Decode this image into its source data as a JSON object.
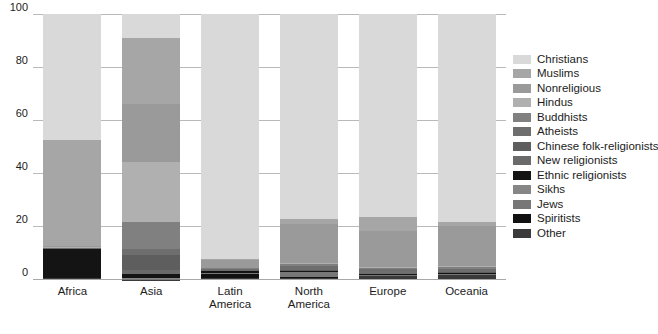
{
  "chart_data": {
    "type": "bar",
    "title": "",
    "subtitle": "",
    "xlabel": "",
    "ylabel": "",
    "ylim": [
      0,
      100
    ],
    "yticks": [
      0,
      20,
      40,
      60,
      80,
      100
    ],
    "grid": true,
    "stacked": true,
    "stack_order": "top-down",
    "legend_position": "right",
    "categories": [
      "Africa",
      "Asia",
      "Latin America",
      "North America",
      "Europe",
      "Oceania"
    ],
    "category_labels": [
      [
        "Africa"
      ],
      [
        "Asia"
      ],
      [
        "Latin",
        "America"
      ],
      [
        "North",
        "America"
      ],
      [
        "Europe"
      ],
      [
        "Oceania"
      ]
    ],
    "series": [
      {
        "name": "Christians",
        "color": "#d9d9d9",
        "values": [
          47.5,
          9.0,
          92.5,
          77.5,
          76.5,
          78.5
        ]
      },
      {
        "name": "Muslims",
        "color": "#a6a6a6",
        "values": [
          40.0,
          25.0,
          0.3,
          1.8,
          5.5,
          1.5
        ]
      },
      {
        "name": "Nonreligious",
        "color": "#9a9a9a",
        "values": [
          0.5,
          22.0,
          3.0,
          14.5,
          13.5,
          15.0
        ]
      },
      {
        "name": "Hindus",
        "color": "#b0b0b0",
        "values": [
          0.2,
          22.5,
          0.2,
          0.5,
          0.3,
          0.5
        ]
      },
      {
        "name": "Buddhists",
        "color": "#808080",
        "values": [
          0.1,
          10.0,
          0.2,
          0.8,
          0.3,
          0.6
        ]
      },
      {
        "name": "Atheists",
        "color": "#6e6e6e",
        "values": [
          0.1,
          2.5,
          0.4,
          1.5,
          2.0,
          1.3
        ]
      },
      {
        "name": "Chinese folk-religionists",
        "color": "#5e5e5e",
        "values": [
          0.05,
          5.5,
          0.1,
          0.2,
          0.1,
          0.3
        ]
      },
      {
        "name": "New religionists",
        "color": "#6a6a6a",
        "values": [
          0.05,
          1.8,
          0.1,
          0.3,
          0.1,
          0.2
        ]
      },
      {
        "name": "Ethnic religionists",
        "color": "#141414",
        "values": [
          11.0,
          1.2,
          1.0,
          0.2,
          0.1,
          0.2
        ]
      },
      {
        "name": "Sikhs",
        "color": "#868686",
        "values": [
          0.02,
          0.6,
          0.02,
          0.1,
          0.1,
          0.1
        ]
      },
      {
        "name": "Jews",
        "color": "#777777",
        "values": [
          0.05,
          0.2,
          0.2,
          2.0,
          0.4,
          0.3
        ]
      },
      {
        "name": "Spiritists",
        "color": "#111111",
        "values": [
          0.02,
          0.05,
          1.7,
          0.3,
          0.1,
          0.05
        ]
      },
      {
        "name": "Other",
        "color": "#3a3a3a",
        "values": [
          0.41,
          0.15,
          0.26,
          0.3,
          1.0,
          1.45
        ]
      }
    ]
  },
  "legend": {
    "items": [
      {
        "label": "Christians",
        "color": "#d9d9d9"
      },
      {
        "label": "Muslims",
        "color": "#a6a6a6"
      },
      {
        "label": "Nonreligious",
        "color": "#9a9a9a"
      },
      {
        "label": "Hindus",
        "color": "#b0b0b0"
      },
      {
        "label": "Buddhists",
        "color": "#808080"
      },
      {
        "label": "Atheists",
        "color": "#6e6e6e"
      },
      {
        "label": "Chinese folk-religionists",
        "color": "#5e5e5e"
      },
      {
        "label": "New religionists",
        "color": "#6a6a6a"
      },
      {
        "label": "Ethnic religionists",
        "color": "#141414"
      },
      {
        "label": "Sikhs",
        "color": "#868686"
      },
      {
        "label": "Jews",
        "color": "#777777"
      },
      {
        "label": "Spiritists",
        "color": "#111111"
      },
      {
        "label": "Other",
        "color": "#3a3a3a"
      }
    ]
  },
  "axes": {
    "y_tick_labels": [
      "100",
      "80",
      "60",
      "40",
      "20",
      "0"
    ],
    "x_tick_labels": [
      "Africa",
      "Asia",
      "Latin America",
      "North America",
      "Europe",
      "Oceania"
    ]
  }
}
